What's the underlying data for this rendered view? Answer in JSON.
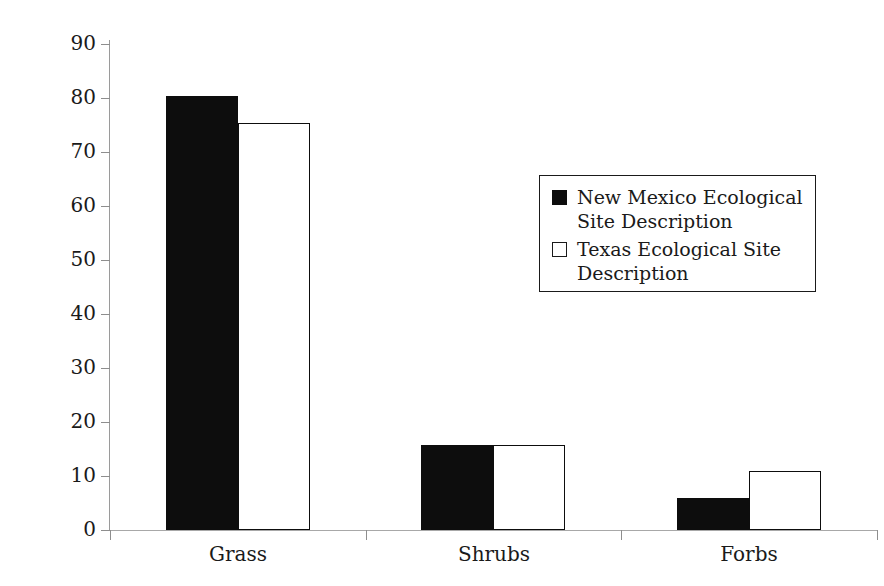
{
  "chart_data": {
    "type": "bar",
    "title": "",
    "subtitle": "",
    "xlabel": "",
    "ylabel": "Percent composition",
    "categories": [
      "Grass",
      "Shrubs",
      "Forbs"
    ],
    "series": [
      {
        "name": "New Mexico Ecological Site Description",
        "values": [
          80.3,
          15.7,
          6.0
        ],
        "fill": "#0d0d0d",
        "style": "filled-black"
      },
      {
        "name": "Texas Ecological Site Description",
        "values": [
          75.3,
          15.7,
          11.0
        ],
        "fill": "#ffffff",
        "style": "open-white-black-outline"
      }
    ],
    "ylim": [
      0,
      90
    ],
    "ytick_step": 10,
    "ytick_labels": [
      "0",
      "10",
      "20",
      "30",
      "40",
      "50",
      "60",
      "70",
      "80",
      "90"
    ],
    "grid": false,
    "legend_position": "upper-right-inside",
    "background": "#ffffff",
    "axis_color": "#9a9a9a",
    "text_color": "#1a1a1a"
  },
  "axes": {
    "y_title": "Percent composition",
    "y_ticks": [
      "90",
      "80",
      "70",
      "60",
      "50",
      "40",
      "30",
      "20",
      "10",
      "0"
    ],
    "x_categories": [
      "Grass",
      "Shrubs",
      "Forbs"
    ]
  },
  "legend": {
    "entries": [
      {
        "label": "New Mexico Ecological Site Description",
        "swatch": "filled-square-icon"
      },
      {
        "label": "Texas Ecological Site Description",
        "swatch": "open-square-icon"
      }
    ]
  }
}
